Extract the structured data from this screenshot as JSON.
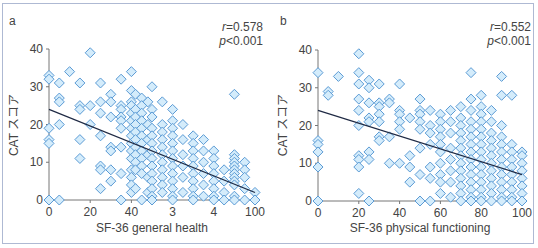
{
  "chart_data": [
    {
      "panel": "a",
      "type": "scatter",
      "title": "",
      "xlabel": "SF-36 general health",
      "ylabel": "CAT スコア",
      "xticks": [
        "0",
        "20",
        "40",
        "3",
        "4",
        "100"
      ],
      "xtick_positions": [
        0,
        20,
        40,
        60,
        80,
        100
      ],
      "yticks": [
        "0",
        "10",
        "20",
        "30",
        "40"
      ],
      "xlim": [
        0,
        100
      ],
      "ylim": [
        0,
        40
      ],
      "grid": false,
      "annotation": {
        "r": "r=0.578",
        "p": "p<0.001"
      },
      "regression": {
        "x0": 0,
        "y0": 24,
        "x1": 100,
        "y1": 2
      },
      "points": [
        [
          0,
          33
        ],
        [
          0,
          32
        ],
        [
          0,
          19
        ],
        [
          0,
          16
        ],
        [
          0,
          15
        ],
        [
          0,
          0
        ],
        [
          5,
          31
        ],
        [
          5,
          27
        ],
        [
          5,
          26
        ],
        [
          5,
          20
        ],
        [
          5,
          0
        ],
        [
          10,
          34
        ],
        [
          15,
          31
        ],
        [
          15,
          25
        ],
        [
          15,
          24
        ],
        [
          15,
          16
        ],
        [
          15,
          11
        ],
        [
          20,
          39
        ],
        [
          20,
          25
        ],
        [
          20,
          20
        ],
        [
          25,
          31
        ],
        [
          25,
          26
        ],
        [
          25,
          23
        ],
        [
          25,
          17
        ],
        [
          25,
          9
        ],
        [
          25,
          8
        ],
        [
          25,
          3
        ],
        [
          30,
          28
        ],
        [
          30,
          26
        ],
        [
          30,
          22
        ],
        [
          30,
          14
        ],
        [
          30,
          13
        ],
        [
          30,
          8
        ],
        [
          30,
          5
        ],
        [
          35,
          32
        ],
        [
          35,
          25
        ],
        [
          35,
          24
        ],
        [
          35,
          22
        ],
        [
          35,
          21
        ],
        [
          35,
          19
        ],
        [
          35,
          14
        ],
        [
          35,
          7
        ],
        [
          35,
          0
        ],
        [
          40,
          34
        ],
        [
          40,
          29
        ],
        [
          40,
          26
        ],
        [
          40,
          25
        ],
        [
          40,
          23
        ],
        [
          40,
          21
        ],
        [
          40,
          19
        ],
        [
          40,
          17
        ],
        [
          40,
          15
        ],
        [
          40,
          13
        ],
        [
          40,
          11
        ],
        [
          40,
          8
        ],
        [
          40,
          6
        ],
        [
          40,
          4
        ],
        [
          40,
          2
        ],
        [
          42,
          28
        ],
        [
          42,
          24
        ],
        [
          42,
          22
        ],
        [
          42,
          20
        ],
        [
          42,
          18
        ],
        [
          42,
          16
        ],
        [
          42,
          14
        ],
        [
          42,
          12
        ],
        [
          42,
          10
        ],
        [
          42,
          8
        ],
        [
          42,
          3
        ],
        [
          45,
          27
        ],
        [
          45,
          25
        ],
        [
          45,
          23
        ],
        [
          45,
          21
        ],
        [
          45,
          19
        ],
        [
          45,
          17
        ],
        [
          45,
          15
        ],
        [
          45,
          13
        ],
        [
          45,
          11
        ],
        [
          45,
          9
        ],
        [
          45,
          7
        ],
        [
          45,
          0
        ],
        [
          48,
          26
        ],
        [
          48,
          20
        ],
        [
          48,
          16
        ],
        [
          48,
          12
        ],
        [
          48,
          6
        ],
        [
          48,
          2
        ],
        [
          50,
          30
        ],
        [
          50,
          24
        ],
        [
          50,
          22
        ],
        [
          50,
          19
        ],
        [
          50,
          17
        ],
        [
          50,
          15
        ],
        [
          50,
          13
        ],
        [
          50,
          11
        ],
        [
          50,
          9
        ],
        [
          50,
          7
        ],
        [
          50,
          5
        ],
        [
          50,
          3
        ],
        [
          50,
          1
        ],
        [
          50,
          0
        ],
        [
          55,
          26
        ],
        [
          55,
          20
        ],
        [
          55,
          18
        ],
        [
          55,
          16
        ],
        [
          55,
          14
        ],
        [
          55,
          12
        ],
        [
          55,
          10
        ],
        [
          55,
          8
        ],
        [
          55,
          6
        ],
        [
          55,
          4
        ],
        [
          55,
          2
        ],
        [
          60,
          24
        ],
        [
          60,
          21
        ],
        [
          60,
          19
        ],
        [
          60,
          17
        ],
        [
          60,
          15
        ],
        [
          60,
          13
        ],
        [
          60,
          11
        ],
        [
          60,
          9
        ],
        [
          60,
          7
        ],
        [
          60,
          5
        ],
        [
          60,
          3
        ],
        [
          60,
          1
        ],
        [
          60,
          0
        ],
        [
          65,
          20
        ],
        [
          65,
          16
        ],
        [
          65,
          12
        ],
        [
          65,
          9
        ],
        [
          65,
          6
        ],
        [
          65,
          2
        ],
        [
          70,
          17
        ],
        [
          70,
          15
        ],
        [
          70,
          13
        ],
        [
          70,
          11
        ],
        [
          70,
          9
        ],
        [
          70,
          7
        ],
        [
          70,
          5
        ],
        [
          70,
          3
        ],
        [
          70,
          1
        ],
        [
          70,
          0
        ],
        [
          75,
          16
        ],
        [
          75,
          13
        ],
        [
          75,
          10
        ],
        [
          75,
          7
        ],
        [
          75,
          4
        ],
        [
          75,
          1
        ],
        [
          80,
          13
        ],
        [
          80,
          11
        ],
        [
          80,
          9
        ],
        [
          80,
          7
        ],
        [
          80,
          5
        ],
        [
          80,
          3
        ],
        [
          80,
          1
        ],
        [
          80,
          0
        ],
        [
          85,
          8
        ],
        [
          85,
          5
        ],
        [
          85,
          2
        ],
        [
          85,
          0
        ],
        [
          90,
          28
        ],
        [
          90,
          12
        ],
        [
          90,
          11
        ],
        [
          90,
          10
        ],
        [
          90,
          9
        ],
        [
          90,
          8
        ],
        [
          90,
          7
        ],
        [
          90,
          6
        ],
        [
          90,
          5
        ],
        [
          90,
          4
        ],
        [
          90,
          1
        ],
        [
          90,
          0
        ],
        [
          95,
          10
        ],
        [
          95,
          8
        ],
        [
          95,
          6
        ],
        [
          95,
          3
        ],
        [
          95,
          0
        ],
        [
          100,
          2
        ],
        [
          100,
          0
        ]
      ]
    },
    {
      "panel": "b",
      "type": "scatter",
      "title": "",
      "xlabel": "SF-36 physical functioning",
      "ylabel": "CAT スコア",
      "xticks": [
        "0",
        "20",
        "40",
        "60",
        "80",
        "100"
      ],
      "xtick_positions": [
        0,
        20,
        40,
        60,
        80,
        100
      ],
      "yticks": [
        "0",
        "10",
        "20",
        "30",
        "40"
      ],
      "xlim": [
        0,
        100
      ],
      "ylim": [
        0,
        40
      ],
      "grid": false,
      "annotation": {
        "r": "r=0.552",
        "p": "p<0.001"
      },
      "regression": {
        "x0": 0,
        "y0": 24,
        "x1": 100,
        "y1": 7
      },
      "points": [
        [
          0,
          34
        ],
        [
          0,
          16
        ],
        [
          0,
          15
        ],
        [
          0,
          13
        ],
        [
          0,
          9
        ],
        [
          0,
          0
        ],
        [
          5,
          29
        ],
        [
          5,
          28
        ],
        [
          10,
          33
        ],
        [
          20,
          39
        ],
        [
          20,
          34
        ],
        [
          20,
          31
        ],
        [
          20,
          27
        ],
        [
          20,
          24
        ],
        [
          20,
          20
        ],
        [
          20,
          12
        ],
        [
          20,
          11
        ],
        [
          20,
          9
        ],
        [
          20,
          2
        ],
        [
          25,
          32
        ],
        [
          25,
          30
        ],
        [
          25,
          26
        ],
        [
          25,
          22
        ],
        [
          25,
          21
        ],
        [
          25,
          13
        ],
        [
          25,
          11
        ],
        [
          25,
          0
        ],
        [
          30,
          31
        ],
        [
          30,
          26
        ],
        [
          30,
          25
        ],
        [
          30,
          23
        ],
        [
          30,
          21
        ],
        [
          30,
          17
        ],
        [
          30,
          16
        ],
        [
          35,
          27
        ],
        [
          35,
          26
        ],
        [
          35,
          17
        ],
        [
          35,
          10
        ],
        [
          40,
          31
        ],
        [
          40,
          24
        ],
        [
          40,
          23
        ],
        [
          40,
          21
        ],
        [
          40,
          19
        ],
        [
          40,
          10
        ],
        [
          45,
          22
        ],
        [
          45,
          12
        ],
        [
          45,
          9
        ],
        [
          45,
          5
        ],
        [
          50,
          27
        ],
        [
          50,
          24
        ],
        [
          50,
          23
        ],
        [
          50,
          21
        ],
        [
          50,
          19
        ],
        [
          50,
          14
        ],
        [
          50,
          7
        ],
        [
          50,
          0
        ],
        [
          55,
          24
        ],
        [
          55,
          20
        ],
        [
          55,
          18
        ],
        [
          55,
          15
        ],
        [
          55,
          9
        ],
        [
          55,
          6
        ],
        [
          55,
          0
        ],
        [
          60,
          23
        ],
        [
          60,
          21
        ],
        [
          60,
          19
        ],
        [
          60,
          17
        ],
        [
          60,
          15
        ],
        [
          60,
          13
        ],
        [
          60,
          10
        ],
        [
          60,
          7
        ],
        [
          60,
          5
        ],
        [
          60,
          2
        ],
        [
          65,
          24
        ],
        [
          65,
          21
        ],
        [
          65,
          18
        ],
        [
          65,
          14
        ],
        [
          65,
          11
        ],
        [
          65,
          8
        ],
        [
          65,
          5
        ],
        [
          65,
          1
        ],
        [
          70,
          25
        ],
        [
          70,
          22
        ],
        [
          70,
          20
        ],
        [
          70,
          18
        ],
        [
          70,
          16
        ],
        [
          70,
          14
        ],
        [
          70,
          12
        ],
        [
          70,
          10
        ],
        [
          70,
          8
        ],
        [
          70,
          6
        ],
        [
          70,
          4
        ],
        [
          70,
          2
        ],
        [
          70,
          0
        ],
        [
          75,
          34
        ],
        [
          75,
          27
        ],
        [
          75,
          24
        ],
        [
          75,
          21
        ],
        [
          75,
          19
        ],
        [
          75,
          17
        ],
        [
          75,
          15
        ],
        [
          75,
          13
        ],
        [
          75,
          11
        ],
        [
          75,
          9
        ],
        [
          75,
          7
        ],
        [
          75,
          5
        ],
        [
          75,
          3
        ],
        [
          75,
          1
        ],
        [
          75,
          0
        ],
        [
          80,
          28
        ],
        [
          80,
          25
        ],
        [
          80,
          23
        ],
        [
          80,
          21
        ],
        [
          80,
          19
        ],
        [
          80,
          17
        ],
        [
          80,
          15
        ],
        [
          80,
          13
        ],
        [
          80,
          11
        ],
        [
          80,
          9
        ],
        [
          80,
          7
        ],
        [
          80,
          5
        ],
        [
          80,
          3
        ],
        [
          80,
          1
        ],
        [
          80,
          0
        ],
        [
          85,
          24
        ],
        [
          85,
          21
        ],
        [
          85,
          18
        ],
        [
          85,
          16
        ],
        [
          85,
          14
        ],
        [
          85,
          12
        ],
        [
          85,
          10
        ],
        [
          85,
          8
        ],
        [
          85,
          6
        ],
        [
          85,
          4
        ],
        [
          85,
          2
        ],
        [
          85,
          0
        ],
        [
          90,
          33
        ],
        [
          90,
          28
        ],
        [
          90,
          20
        ],
        [
          90,
          17
        ],
        [
          90,
          15
        ],
        [
          90,
          13
        ],
        [
          90,
          11
        ],
        [
          90,
          9
        ],
        [
          90,
          7
        ],
        [
          90,
          5
        ],
        [
          90,
          3
        ],
        [
          90,
          1
        ],
        [
          90,
          0
        ],
        [
          95,
          28
        ],
        [
          95,
          15
        ],
        [
          95,
          13
        ],
        [
          95,
          11
        ],
        [
          95,
          9
        ],
        [
          95,
          7
        ],
        [
          95,
          5
        ],
        [
          95,
          3
        ],
        [
          95,
          1
        ],
        [
          95,
          0
        ],
        [
          100,
          13
        ],
        [
          100,
          12
        ],
        [
          100,
          10
        ],
        [
          100,
          8
        ],
        [
          100,
          6
        ],
        [
          100,
          4
        ],
        [
          100,
          2
        ],
        [
          100,
          0
        ]
      ]
    }
  ],
  "panels": [
    {
      "label": "a",
      "r_text": "r",
      "r_value": "=0.578",
      "p_text": "p",
      "p_value": "<0.001",
      "xlabel": "SF-36 general health",
      "ylabel": "CAT スコア"
    },
    {
      "label": "b",
      "r_text": "r",
      "r_value": "=0.552",
      "p_text": "p",
      "p_value": "<0.001",
      "xlabel": "SF-36 physical functioning",
      "ylabel": "CAT スコア"
    }
  ],
  "colors": {
    "marker_fill": "#d4ecfb",
    "marker_stroke": "#5b9bd5",
    "axis": "#777777",
    "regression": "#1f2a44",
    "frame": "#aeb9d3",
    "text": "#444444"
  }
}
